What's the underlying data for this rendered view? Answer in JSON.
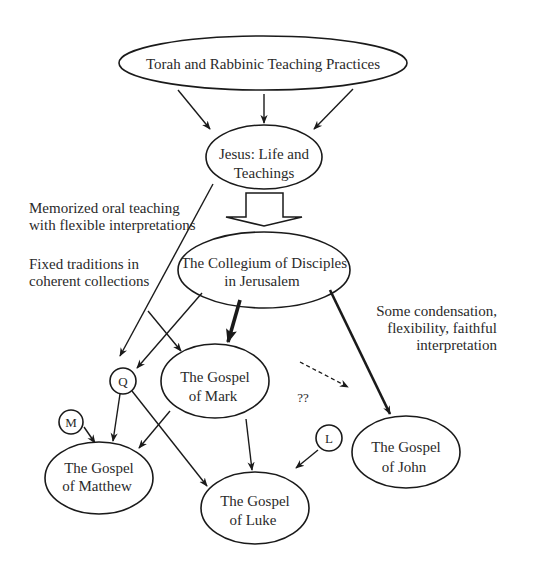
{
  "nodes": {
    "torah": {
      "line1": "Torah and Rabbinic Teaching Practices"
    },
    "jesus": {
      "line1": "Jesus: Life and",
      "line2": "Teachings"
    },
    "collegium": {
      "line1": "The Collegium of Disciples",
      "line2": "in Jerusalem"
    },
    "mark": {
      "line1": "The Gospel",
      "line2": "of Mark"
    },
    "matthew": {
      "line1": "The Gospel",
      "line2": "of Matthew"
    },
    "luke": {
      "line1": "The Gospel",
      "line2": "of Luke"
    },
    "john": {
      "line1": "The Gospel",
      "line2": "of John"
    },
    "q": {
      "label": "Q"
    },
    "m": {
      "label": "M"
    },
    "l": {
      "label": "L"
    }
  },
  "annotations": {
    "oral": {
      "line1": "Memorized oral teaching",
      "line2": "with flexible interpretations"
    },
    "fixed": {
      "line1": "Fixed traditions in",
      "line2": "coherent collections"
    },
    "condensation": {
      "line1": "Some condensation,",
      "line2": "flexibility, faithful",
      "line3": "interpretation"
    },
    "uncertain": {
      "label": "??"
    }
  }
}
